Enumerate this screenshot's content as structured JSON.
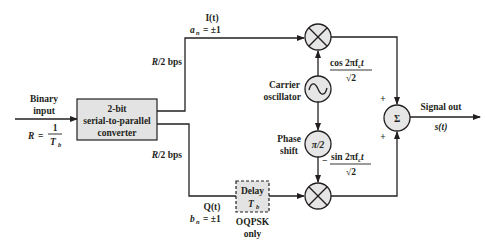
{
  "diagram": {
    "type": "block-diagram",
    "input": {
      "label_line1": "Binary",
      "label_line2": "input",
      "rate_lhs": "R",
      "rate_eq": "=",
      "rate_num": "1",
      "rate_den": "T",
      "rate_den_sub": "b"
    },
    "converter": {
      "line1": "2-bit",
      "line2": "serial-to-parallel",
      "line3": "converter"
    },
    "upper_branch": {
      "rate": "R/2 bps",
      "signal": "I(t)",
      "symbol": "a",
      "symbol_sub": "n",
      "symbol_value": "= ±1"
    },
    "lower_branch": {
      "rate": "R/2 bps",
      "signal": "Q(t)",
      "symbol": "b",
      "symbol_sub": "n",
      "symbol_value": "= ±1"
    },
    "delay": {
      "line1": "Delay",
      "line2": "T",
      "line2_sub": "b",
      "note_line1": "OQPSK",
      "note_line2": "only"
    },
    "oscillator": {
      "label_line1": "Carrier",
      "label_line2": "oscillator",
      "symbol": "~",
      "cos_num": "cos 2πf",
      "cos_num_sub": "c",
      "cos_num_t": "t",
      "cos_den": "√2"
    },
    "phase_shift": {
      "label_line1": "Phase",
      "label_line2": "shift",
      "symbol": "π/2",
      "sin_sign": "−",
      "sin_num": "sin 2πf",
      "sin_num_sub": "c",
      "sin_num_t": "t",
      "sin_den": "√2"
    },
    "summer": {
      "symbol": "Σ",
      "plus_top": "+",
      "plus_bottom": "+"
    },
    "output": {
      "label": "Signal out",
      "signal": "s(t)"
    },
    "colors": {
      "stroke": "#231f20",
      "block_fill": "#e3e3e3",
      "circle_fill": "#e6e6e6"
    }
  }
}
